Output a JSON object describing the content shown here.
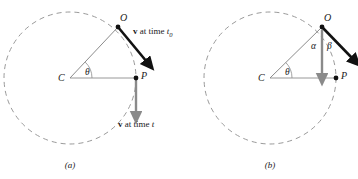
{
  "figure": {
    "background_color": "#ffffff",
    "ink_color": "#1a1a1a",
    "circle_color": "#9a9a9a",
    "radius_line_color": "#8c8c8c",
    "gray_vector_color": "#8a8a8a",
    "black_vector_color": "#111111"
  },
  "panel_a": {
    "caption": "(a)",
    "circle": {
      "cx": 70,
      "cy": 78,
      "r": 66,
      "style": "dashed"
    },
    "points": [
      {
        "name": "C",
        "label": "C",
        "x": 70,
        "y": 78,
        "label_x": 58,
        "label_y": 73,
        "dot": false
      },
      {
        "name": "P",
        "label": "P",
        "x": 136,
        "y": 78,
        "label_x": 141,
        "label_y": 71,
        "dot": true
      },
      {
        "name": "O",
        "label": "O",
        "x": 118,
        "y": 27,
        "label_x": 120,
        "label_y": 13,
        "dot": true
      }
    ],
    "angle": {
      "symbol": "θ",
      "label_x": 85,
      "label_y": 68
    },
    "vectors": [
      {
        "name": "v-at-time-t0",
        "label_html": "<b>v</b> at time <i>t</i><sub>0</sub>",
        "color": "black",
        "from_x": 118,
        "from_y": 27,
        "to_x": 147,
        "to_y": 62,
        "label_x": 133,
        "label_y": 27
      },
      {
        "name": "v-at-time-t",
        "label_html": "<b>v</b> at time <i>t</i>",
        "color": "gray",
        "from_x": 136,
        "from_y": 78,
        "to_x": 136,
        "to_y": 114,
        "label_x": 118,
        "label_y": 120
      }
    ]
  },
  "panel_b": {
    "caption": "(b)",
    "circle": {
      "cx": 270,
      "cy": 78,
      "r": 66,
      "style": "dashed"
    },
    "points": [
      {
        "name": "C",
        "label": "C",
        "x": 270,
        "y": 78,
        "label_x": 258,
        "label_y": 73,
        "dot": false
      },
      {
        "name": "P",
        "label": "P",
        "x": 336,
        "y": 78,
        "label_x": 341,
        "label_y": 71,
        "dot": true
      },
      {
        "name": "O",
        "label": "O",
        "x": 322,
        "y": 27,
        "label_x": 324,
        "label_y": 13,
        "dot": true
      }
    ],
    "angles": [
      {
        "symbol": "θ",
        "name": "theta",
        "label_x": 285,
        "label_y": 68
      },
      {
        "symbol": "α",
        "name": "alpha",
        "label_x": 311,
        "label_y": 42
      },
      {
        "symbol": "β",
        "name": "beta",
        "label_x": 327,
        "label_y": 42
      }
    ],
    "vectors": [
      {
        "name": "v-vertical-component",
        "color": "gray",
        "from_x": 322,
        "from_y": 30,
        "to_x": 322,
        "to_y": 76
      },
      {
        "name": "v-tangential",
        "color": "black",
        "from_x": 322,
        "from_y": 27,
        "to_x": 353,
        "to_y": 59
      }
    ]
  }
}
